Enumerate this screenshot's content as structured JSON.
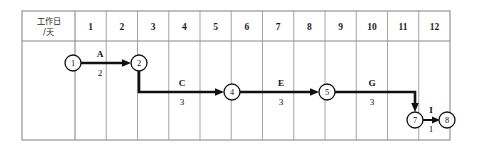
{
  "table": {
    "corner_header": {
      "line1": "工作日",
      "line2": "/天"
    },
    "day_columns": [
      "1",
      "2",
      "3",
      "4",
      "5",
      "6",
      "7",
      "8",
      "9",
      "10",
      "11",
      "12"
    ]
  },
  "network": {
    "nodes": [
      {
        "id": "1",
        "label": "1",
        "cx": 73,
        "cy": 63,
        "r": 8
      },
      {
        "id": "2",
        "label": "2",
        "cx": 139,
        "cy": 63,
        "r": 8
      },
      {
        "id": "4",
        "label": "4",
        "cx": 232,
        "cy": 92,
        "r": 8
      },
      {
        "id": "5",
        "label": "5",
        "cx": 327,
        "cy": 92,
        "r": 8
      },
      {
        "id": "7",
        "label": "7",
        "cx": 415,
        "cy": 120,
        "r": 8
      },
      {
        "id": "8",
        "label": "8",
        "cx": 447,
        "cy": 120,
        "r": 8
      }
    ],
    "activities": [
      {
        "name": "A",
        "duration": "2",
        "from": "1",
        "to": "2",
        "name_x": 100,
        "name_y": 57,
        "dur_x": 100,
        "dur_y": 76
      },
      {
        "name": "C",
        "duration": "3",
        "from": "2",
        "to": "4",
        "name_x": 182,
        "name_y": 86,
        "dur_x": 182,
        "dur_y": 105
      },
      {
        "name": "E",
        "duration": "3",
        "from": "4",
        "to": "5",
        "name_x": 281,
        "name_y": 86,
        "dur_x": 281,
        "dur_y": 105
      },
      {
        "name": "G",
        "duration": "3",
        "from": "5",
        "to": "7",
        "name_x": 372,
        "name_y": 86,
        "dur_x": 372,
        "dur_y": 105
      },
      {
        "name": "I",
        "duration": "1",
        "from": "7",
        "to": "8",
        "name_x": 431,
        "name_y": 113,
        "dur_x": 431,
        "dur_y": 132
      }
    ]
  },
  "colors": {
    "stroke": "#111111",
    "grid": "#9a9a9a",
    "border": "#8a8a8a",
    "background": "#ffffff"
  },
  "geometry": {
    "table_left": 22,
    "table_right": 450,
    "table_top": 11,
    "table_bottom": 140,
    "header_bottom": 41,
    "label_col_right": 75,
    "col_width": 31.25
  }
}
